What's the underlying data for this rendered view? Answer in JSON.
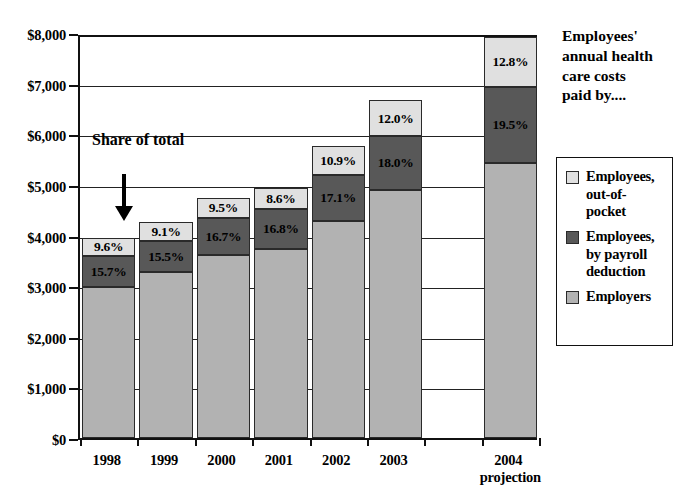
{
  "chart_data": {
    "type": "bar",
    "subtype": "stacked-bar",
    "title": "",
    "xlabel": "",
    "ylabel": "",
    "ylim": [
      0,
      8000
    ],
    "ytick_values": [
      0,
      1000,
      2000,
      3000,
      4000,
      5000,
      6000,
      7000,
      8000
    ],
    "ytick_labels": [
      "$0",
      "$1,000",
      "$2,000",
      "$3,000",
      "$4,000",
      "$5,000",
      "$6,000",
      "$7,000",
      "$8,000"
    ],
    "grid": true,
    "legend_position": "right",
    "categories": [
      "1998",
      "1999",
      "2000",
      "2001",
      "2002",
      "2003",
      "",
      "2004"
    ],
    "category_sublabels": [
      "",
      "",
      "",
      "",
      "",
      "",
      "",
      "projection"
    ],
    "series": [
      {
        "name": "Employers",
        "color": "#b2b2b2",
        "values": [
          2990,
          3280,
          3610,
          3740,
          4290,
          4900,
          null,
          5430
        ]
      },
      {
        "name": "Employees, by payroll deduction",
        "color": "#585858",
        "values": [
          600,
          620,
          740,
          790,
          900,
          1060,
          null,
          1510
        ]
      },
      {
        "name": "Employees, out-of-pocket",
        "color": "#e0e0e0",
        "values": [
          370,
          360,
          390,
          400,
          570,
          710,
          null,
          990
        ]
      }
    ],
    "data_labels": {
      "Employees, out-of-pocket": [
        "9.6%",
        "9.1%",
        "9.5%",
        "8.6%",
        "10.9%",
        "12.0%",
        "",
        "12.8%"
      ],
      "Employees, by payroll deduction": [
        "15.7%",
        "15.5%",
        "16.7%",
        "16.8%",
        "17.1%",
        "18.0%",
        "",
        "19.5%"
      ],
      "Employers": [
        "",
        "",
        "",
        "",
        "",
        "",
        "",
        ""
      ]
    },
    "totals": [
      3960,
      4260,
      4740,
      4930,
      5760,
      6670,
      null,
      7930
    ],
    "annotations": [
      {
        "text": "Share\nof total",
        "points_to": "1998 out-of-pocket segment"
      }
    ]
  },
  "legend": {
    "title": "Employees'\nannual health\ncare costs\npaid by....",
    "items": [
      {
        "label": "Employees,\nout-of-\npocket",
        "color": "#e0e0e0"
      },
      {
        "label": "Employees,\nby payroll\ndeduction",
        "color": "#585858"
      },
      {
        "label": "Employers",
        "color": "#b2b2b2"
      }
    ]
  },
  "annotation": {
    "share_of_total": "Share\nof total"
  }
}
